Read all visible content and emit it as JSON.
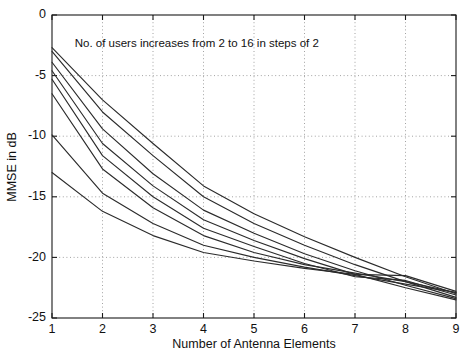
{
  "chart_data": {
    "type": "line",
    "title": "",
    "xlabel": "Number of Antenna Elements",
    "ylabel": "MMSE in dB",
    "xlim": [
      1,
      9
    ],
    "ylim": [
      -25,
      0
    ],
    "xticks": [
      1,
      2,
      3,
      4,
      5,
      6,
      7,
      8,
      9
    ],
    "xtick_labels": [
      "1",
      "2",
      "3",
      "4",
      "5",
      "6",
      "7",
      "8",
      "9"
    ],
    "yticks": [
      0,
      -5,
      -10,
      -15,
      -20,
      -25
    ],
    "ytick_labels": [
      "0",
      "-5",
      "-10",
      "-15",
      "-20",
      "-25"
    ],
    "grid": true,
    "grid_style": "dotted",
    "legend": "none",
    "annotations": [
      {
        "text": "No. of users increases from 2 to 16 in steps of 2",
        "x": 1.45,
        "y": -2.6
      }
    ],
    "x": [
      1,
      2,
      3,
      4,
      5,
      6,
      7,
      8,
      9
    ],
    "series": [
      {
        "name": "2 users",
        "values": [
          -2.7,
          -7.0,
          -10.6,
          -14.1,
          -16.4,
          -18.3,
          -20.0,
          -21.6,
          -23.0
        ]
      },
      {
        "name": "4 users",
        "values": [
          -3.0,
          -8.0,
          -11.6,
          -15.0,
          -17.2,
          -19.0,
          -20.6,
          -22.0,
          -23.3
        ]
      },
      {
        "name": "6 users",
        "values": [
          -3.9,
          -9.4,
          -13.1,
          -16.1,
          -18.0,
          -19.7,
          -21.1,
          -22.3,
          -23.4
        ]
      },
      {
        "name": "8 users",
        "values": [
          -4.6,
          -10.6,
          -14.1,
          -16.9,
          -18.6,
          -20.1,
          -21.4,
          -22.5,
          -23.5
        ]
      },
      {
        "name": "10 users",
        "values": [
          -5.3,
          -11.6,
          -15.0,
          -17.6,
          -19.1,
          -20.5,
          -21.6,
          -21.9,
          -23.1
        ]
      },
      {
        "name": "12 users",
        "values": [
          -6.5,
          -12.7,
          -15.9,
          -18.2,
          -19.6,
          -20.6,
          -21.3,
          -22.0,
          -22.9
        ]
      },
      {
        "name": "14 users",
        "values": [
          -9.9,
          -14.7,
          -17.2,
          -19.0,
          -20.0,
          -20.8,
          -21.5,
          -22.2,
          -22.9
        ]
      },
      {
        "name": "16 users",
        "values": [
          -13.0,
          -16.2,
          -18.2,
          -19.6,
          -20.3,
          -20.9,
          -21.4,
          -21.5,
          -22.8
        ]
      }
    ]
  },
  "axes": {
    "x_title": "Number of Antenna Elements",
    "y_title": "MMSE in dB"
  },
  "annotation": {
    "note": "No. of users increases from 2 to 16 in steps of 2"
  },
  "colors": {
    "line": "#2b2b2b",
    "axis": "#1a1a1a",
    "grid": "#8c8c8c",
    "background": "#ffffff"
  }
}
